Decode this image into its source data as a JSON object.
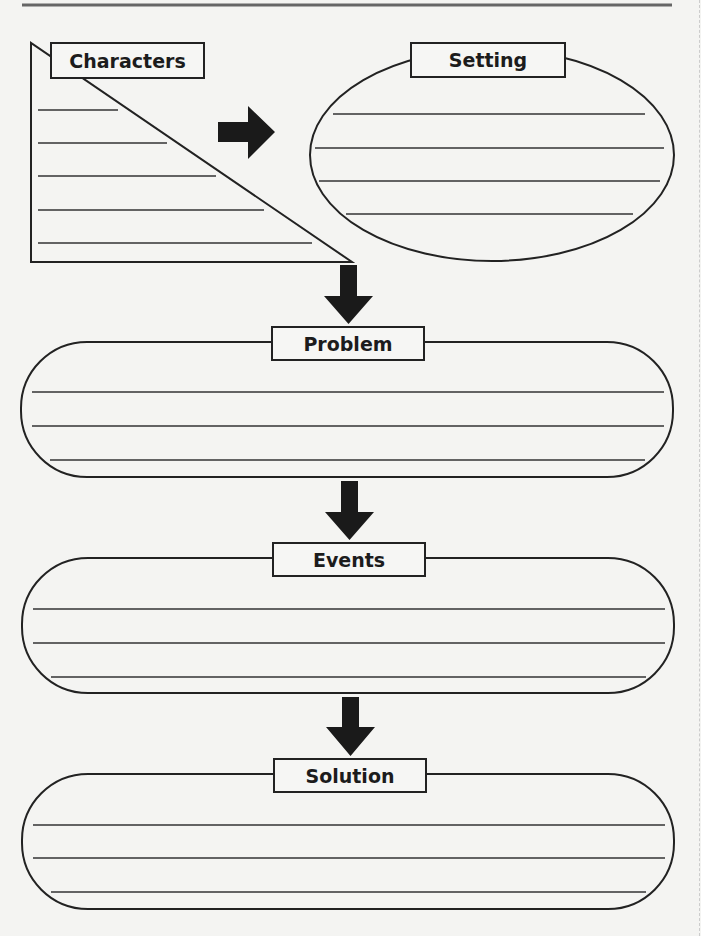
{
  "worksheet": {
    "title": "Story Map",
    "colors": {
      "line": "#222222",
      "arrow": "#1a1a1a",
      "paper": "#f4f4f2",
      "header_rule": "#555555"
    },
    "sections": [
      {
        "id": "characters",
        "label": "Characters",
        "shape": "right-triangle",
        "write_lines": 5
      },
      {
        "id": "setting",
        "label": "Setting",
        "shape": "ellipse",
        "write_lines": 4
      },
      {
        "id": "problem",
        "label": "Problem",
        "shape": "rounded-capsule",
        "write_lines": 3
      },
      {
        "id": "events",
        "label": "Events",
        "shape": "rounded-capsule",
        "write_lines": 3
      },
      {
        "id": "solution",
        "label": "Solution",
        "shape": "rounded-capsule",
        "write_lines": 3
      }
    ],
    "arrows": [
      {
        "from": "characters",
        "to": "setting",
        "direction": "right"
      },
      {
        "from": "characters",
        "to": "problem",
        "direction": "down"
      },
      {
        "from": "problem",
        "to": "events",
        "direction": "down"
      },
      {
        "from": "events",
        "to": "solution",
        "direction": "down"
      }
    ]
  }
}
